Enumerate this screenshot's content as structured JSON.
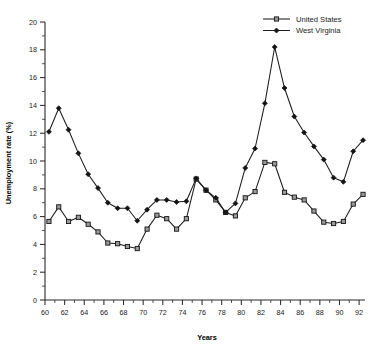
{
  "chart_data": {
    "type": "line",
    "title": "",
    "xlabel": "Years",
    "ylabel": "Unemployment rate (%)",
    "xlim": [
      60,
      92.6
    ],
    "ylim": [
      0,
      20
    ],
    "x_tick_step": 2,
    "x_minor_step": 1,
    "y_tick_step": 2,
    "y_minor_step": 1,
    "grid": false,
    "legend_position": "top-right",
    "x_tick_labels": [
      "60",
      "62",
      "64",
      "66",
      "68",
      "70",
      "72",
      "74",
      "76",
      "78",
      "80",
      "82",
      "84",
      "86",
      "88",
      "90",
      "92"
    ],
    "y_tick_labels": [
      "0",
      "2",
      "4",
      "6",
      "8",
      "10",
      "12",
      "14",
      "16",
      "18",
      "20"
    ],
    "x": [
      60.4,
      61.4,
      62.4,
      63.4,
      64.4,
      65.4,
      66.4,
      67.4,
      68.4,
      69.4,
      70.4,
      71.4,
      72.4,
      73.4,
      74.4,
      75.4,
      76.4,
      77.4,
      78.4,
      79.4,
      80.4,
      81.4,
      82.4,
      83.4,
      84.4,
      85.4,
      86.4,
      87.4,
      88.4,
      89.4,
      90.4,
      91.4,
      92.4
    ],
    "series": [
      {
        "name": "United States",
        "marker": "open-square",
        "values": [
          5.65,
          6.7,
          5.65,
          5.95,
          5.45,
          4.9,
          4.1,
          4.05,
          3.85,
          3.7,
          5.1,
          6.1,
          5.85,
          5.1,
          5.85,
          8.7,
          7.9,
          7.2,
          6.3,
          6.05,
          7.35,
          7.8,
          9.9,
          9.8,
          7.75,
          7.4,
          7.2,
          6.4,
          5.6,
          5.5,
          5.65,
          6.9,
          7.6
        ]
      },
      {
        "name": "West Virginia",
        "marker": "filled-diamond",
        "values": [
          12.1,
          13.8,
          12.25,
          10.55,
          9.05,
          8.05,
          7.0,
          6.6,
          6.6,
          5.7,
          6.5,
          7.2,
          7.2,
          7.05,
          7.1,
          8.75,
          7.9,
          7.35,
          6.3,
          6.95,
          9.5,
          10.9,
          14.15,
          18.2,
          15.25,
          13.2,
          12.05,
          11.05,
          10.1,
          8.8,
          8.5,
          10.7,
          11.5
        ]
      }
    ]
  },
  "legend": {
    "entries": [
      {
        "label": "United States",
        "marker": "open-square"
      },
      {
        "label": "West Virginia",
        "marker": "filled-diamond"
      }
    ]
  },
  "colors": {
    "line": "#1c1c1c",
    "marker_open_fill": "#9a9a9a",
    "marker_edge": "#141414",
    "axis": "#2b2b2b",
    "text": "#1a1a1a",
    "background": "#ffffff"
  }
}
